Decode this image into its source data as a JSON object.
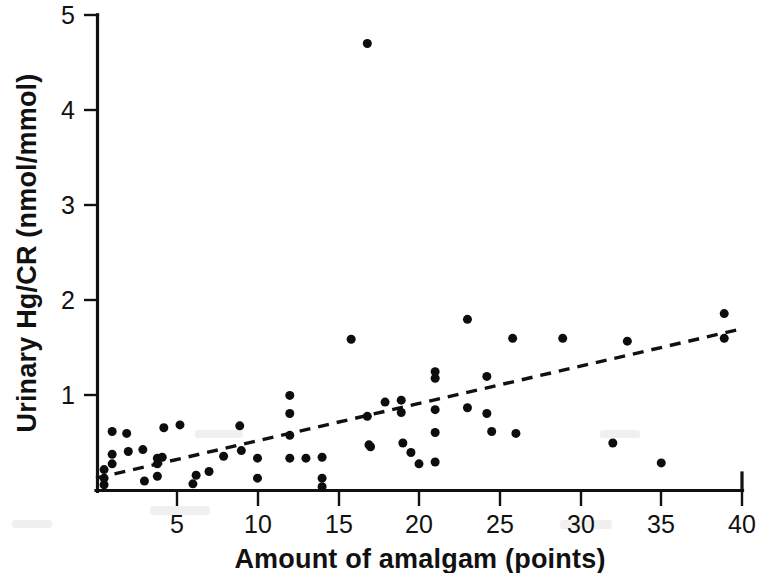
{
  "chart_data": {
    "type": "scatter",
    "title": "",
    "subtitle": "",
    "xlabel": "Amount of amalgam (points)",
    "ylabel": "Urinary Hg/CR (nmol/mmol)",
    "xlim": [
      0,
      40
    ],
    "ylim": [
      0,
      5
    ],
    "xticks": [
      5,
      10,
      15,
      20,
      25,
      30,
      35,
      40
    ],
    "yticks": [
      1,
      2,
      3,
      4,
      5
    ],
    "xtick_labels": [
      "5",
      "10",
      "15",
      "20",
      "25",
      "30",
      "35",
      "40"
    ],
    "ytick_labels": [
      "1",
      "2",
      "3",
      "4",
      "5"
    ],
    "grid": false,
    "legend": null,
    "legend_position": "none",
    "marker": "filled-circle",
    "marker_color": "#0d0d0d",
    "marker_size_px": 9,
    "points": [
      [
        0.5,
        0.22
      ],
      [
        0.5,
        0.13
      ],
      [
        0.5,
        0.06
      ],
      [
        1.0,
        0.38
      ],
      [
        1.0,
        0.28
      ],
      [
        1.0,
        0.62
      ],
      [
        1.9,
        0.6
      ],
      [
        2.0,
        0.41
      ],
      [
        2.9,
        0.43
      ],
      [
        3.0,
        0.1
      ],
      [
        3.8,
        0.15
      ],
      [
        3.8,
        0.34
      ],
      [
        3.8,
        0.28
      ],
      [
        4.2,
        0.66
      ],
      [
        5.2,
        0.69
      ],
      [
        4.1,
        0.35
      ],
      [
        6.0,
        0.07
      ],
      [
        6.2,
        0.16
      ],
      [
        7.0,
        0.2
      ],
      [
        7.9,
        0.36
      ],
      [
        8.9,
        0.68
      ],
      [
        9.0,
        0.42
      ],
      [
        10.0,
        0.34
      ],
      [
        10.0,
        0.13
      ],
      [
        12.0,
        1.0
      ],
      [
        12.0,
        0.81
      ],
      [
        12.0,
        0.58
      ],
      [
        12.0,
        0.34
      ],
      [
        13.0,
        0.34
      ],
      [
        14.0,
        0.35
      ],
      [
        14.0,
        0.13
      ],
      [
        14.0,
        0.04
      ],
      [
        15.8,
        1.59
      ],
      [
        16.8,
        4.7
      ],
      [
        16.8,
        0.78
      ],
      [
        16.9,
        0.48
      ],
      [
        17.9,
        0.93
      ],
      [
        17.0,
        0.46
      ],
      [
        18.9,
        0.82
      ],
      [
        18.9,
        0.95
      ],
      [
        19.0,
        0.5
      ],
      [
        19.5,
        0.4
      ],
      [
        20.0,
        0.28
      ],
      [
        21.0,
        1.18
      ],
      [
        21.0,
        1.25
      ],
      [
        21.0,
        0.85
      ],
      [
        21.0,
        0.61
      ],
      [
        21.0,
        0.3
      ],
      [
        23.0,
        1.8
      ],
      [
        23.0,
        0.87
      ],
      [
        24.2,
        1.2
      ],
      [
        24.2,
        0.81
      ],
      [
        24.5,
        0.62
      ],
      [
        25.8,
        1.6
      ],
      [
        26.0,
        0.6
      ],
      [
        28.9,
        1.6
      ],
      [
        32.0,
        0.5
      ],
      [
        32.9,
        1.57
      ],
      [
        35.0,
        0.29
      ],
      [
        38.9,
        1.86
      ],
      [
        38.9,
        1.6
      ]
    ],
    "trend_line": {
      "style": "dashed",
      "color": "#111111",
      "x_start": 0.0,
      "y_start": 0.13,
      "x_end": 40.0,
      "y_end": 1.7
    },
    "n_points": 62
  },
  "figure": {
    "background_color": "#ffffff",
    "axes_color": "#111111",
    "width_px": 757,
    "height_px": 573
  }
}
